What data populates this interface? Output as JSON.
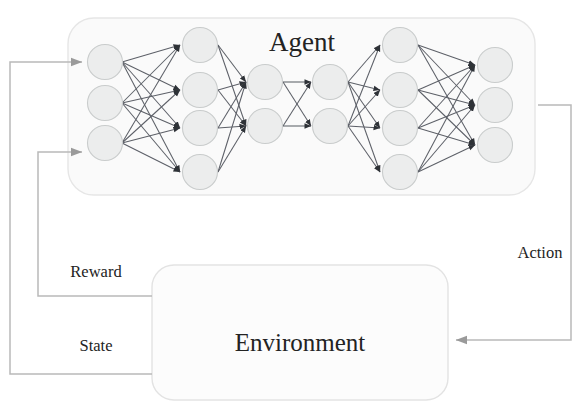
{
  "diagram": {
    "agent": {
      "label": "Agent",
      "box": {
        "x": 68,
        "y": 18,
        "width": 467,
        "height": 177,
        "radius": 26
      },
      "network": {
        "layer_sizes": [
          3,
          4,
          2,
          2,
          4,
          3
        ],
        "node_radius": 17.5,
        "layers": [
          {
            "name": "input-layer",
            "x": 105,
            "nodes_y": [
              62,
              103,
              143
            ]
          },
          {
            "name": "hidden-layer-1",
            "x": 200,
            "nodes_y": [
              45,
              90,
              128,
              172
            ]
          },
          {
            "name": "bottleneck-layer-1",
            "x": 265,
            "nodes_y": [
              82,
              126
            ]
          },
          {
            "name": "bottleneck-layer-2",
            "x": 330,
            "nodes_y": [
              82,
              126
            ]
          },
          {
            "name": "hidden-layer-2",
            "x": 400,
            "nodes_y": [
              45,
              90,
              128,
              172
            ]
          },
          {
            "name": "output-layer",
            "x": 495,
            "nodes_y": [
              65,
              105,
              145
            ]
          }
        ]
      }
    },
    "environment": {
      "label": "Environment",
      "box": {
        "x": 152,
        "y": 265,
        "width": 296,
        "height": 135,
        "radius": 22
      }
    },
    "flows": [
      {
        "name": "state-flow",
        "label": "State",
        "label_x": 100,
        "label_y": 350
      },
      {
        "name": "reward-flow",
        "label": "Reward",
        "label_x": 100,
        "label_y": 277
      },
      {
        "name": "action-flow",
        "label": "Action",
        "label_x": 542,
        "label_y": 253
      }
    ],
    "colors": {
      "node_fill": "#eceded",
      "node_stroke": "#c9cccc",
      "synapse": "#5d6068",
      "flow_line": "#b9b9b9",
      "text": "#232323",
      "agent_box_fill": "#fafafa",
      "background": "#ffffff"
    }
  }
}
